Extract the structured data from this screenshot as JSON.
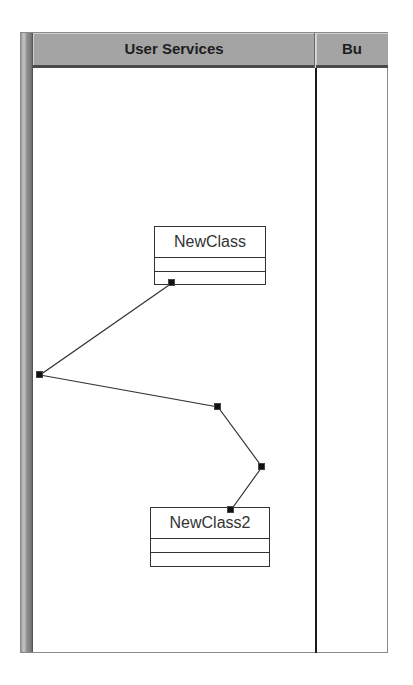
{
  "swimlanes": [
    {
      "label": "User Services"
    },
    {
      "label": "Bu"
    }
  ],
  "classes": [
    {
      "name": "NewClass"
    },
    {
      "name": "NewClass2"
    }
  ],
  "connector": {
    "points": [
      [
        172,
        283
      ],
      [
        40,
        375
      ],
      [
        218,
        407
      ],
      [
        262,
        467
      ],
      [
        231,
        510
      ]
    ],
    "color": "#333333"
  },
  "colors": {
    "header_bg": "#a4a4a4",
    "line": "#333333",
    "handle": "#111111"
  }
}
